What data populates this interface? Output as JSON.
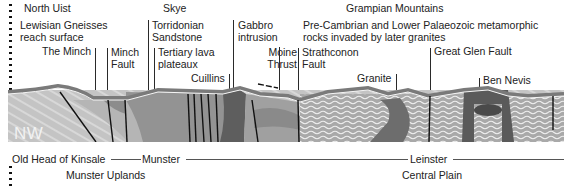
{
  "diagram": {
    "direction_label": "NW",
    "top_labels": [
      {
        "id": "north-uist",
        "text": "North Uist"
      },
      {
        "id": "lewisian",
        "line1": "Lewisian Gneisses",
        "line2": "reach surface"
      },
      {
        "id": "the-minch",
        "text": "The Minch"
      },
      {
        "id": "minch-fault",
        "line1": "Minch",
        "line2": "Fault"
      },
      {
        "id": "skye",
        "text": "Skye"
      },
      {
        "id": "torridonian",
        "line1": "Torridonian",
        "line2": "Sandstone"
      },
      {
        "id": "tertiary-lava",
        "line1": "Tertiary lava",
        "line2": "plateaux"
      },
      {
        "id": "cuillins",
        "text": "Cuillins"
      },
      {
        "id": "gabbro",
        "line1": "Gabbro",
        "line2": "intrusion"
      },
      {
        "id": "moine-thrust",
        "line1": "Moine",
        "line2": "Thrust"
      },
      {
        "id": "grampian",
        "text": "Grampian Mountains"
      },
      {
        "id": "precambrian",
        "line1": "Pre-Cambrian and Lower Palaeozoic metamorphic",
        "line2": "rocks invaded by later granites"
      },
      {
        "id": "strathconon",
        "line1": "Strathconon",
        "line2": "Fault"
      },
      {
        "id": "granite",
        "text": "Granite"
      },
      {
        "id": "great-glen",
        "text": "Great Glen Fault"
      },
      {
        "id": "ben-nevis",
        "text": "Ben Nevis"
      }
    ],
    "bottom_labels": {
      "old_head": "Old Head of Kinsale",
      "munster": "Munster",
      "leinster": "Leinster",
      "munster_uplands": "Munster Uplands",
      "central_plain": "Central Plain"
    },
    "colors": {
      "background": "#ffffff",
      "light_rock": "#c9c9c9",
      "mid_rock": "#a3a3a3",
      "dark_rock": "#6f6f6f",
      "darkest_rock": "#555555",
      "surface_band": "#8a8a8a",
      "fold_lines": "#f3f3f3",
      "fault_lines": "#111111"
    }
  }
}
